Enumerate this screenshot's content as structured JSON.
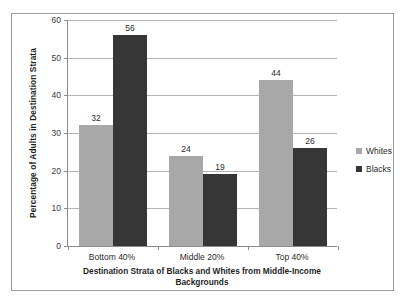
{
  "chart_data": {
    "type": "bar",
    "title": "",
    "subtitle": "",
    "xlabel": "Destination Strata of Blacks and Whites from Middle-Income Backgrounds",
    "xlabel_lines": [
      "Destination Strata of Blacks and Whites from Middle-Income",
      "Backgrounds"
    ],
    "ylabel": "Percentage of Adults in Destination Strata",
    "categories": [
      "Bottom 40%",
      "Middle 20%",
      "Top 40%"
    ],
    "series": [
      {
        "name": "Whites",
        "color": "#a8a8a8",
        "values": [
          32,
          24,
          44
        ]
      },
      {
        "name": "Blacks",
        "color": "#363636",
        "values": [
          56,
          19,
          26
        ]
      }
    ],
    "ylim": [
      0,
      60
    ],
    "yticks": [
      0,
      10,
      20,
      30,
      40,
      50,
      60
    ],
    "ytick_labels": [
      "0",
      "10",
      "20",
      "30",
      "40",
      "50",
      "60"
    ],
    "grid": true,
    "grid_axis": "y",
    "legend_position": "right",
    "data_labels": true
  },
  "legend": {
    "entries": [
      {
        "label": "Whites",
        "swatch": "#a8a8a8"
      },
      {
        "label": "Blacks",
        "swatch": "#363636"
      }
    ]
  },
  "colors": {
    "whites_bar": "#a8a8a8",
    "blacks_bar": "#363636",
    "gridline": "#b4b4b4",
    "axis": "#8c8c8c",
    "frame_border": "#9a9a9a",
    "background": "#ffffff",
    "text": "#2b2b2b"
  }
}
